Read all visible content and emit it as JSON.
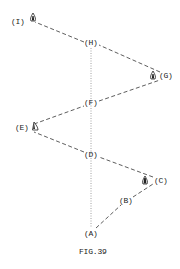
{
  "figure": {
    "caption": "FIG.39",
    "colors": {
      "line": "#333333",
      "dotted_axis": "#888888",
      "text": "#222222",
      "background": "#ffffff"
    },
    "axis": {
      "style": "dotted",
      "x": 91,
      "y_start": 48,
      "y_end": 228
    },
    "points": [
      {
        "id": "A",
        "label": "(A)",
        "x": 91,
        "y": 234,
        "icon": null
      },
      {
        "id": "B",
        "label": "(B)",
        "x": 126,
        "y": 201,
        "icon": null
      },
      {
        "id": "C",
        "label": "(C)",
        "x": 161,
        "y": 181,
        "icon": "drop-shaped-marker-icon"
      },
      {
        "id": "D",
        "label": "(D)",
        "x": 91,
        "y": 155,
        "icon": null
      },
      {
        "id": "E",
        "label": "(E)",
        "x": 23,
        "y": 128,
        "icon": "drop-shaped-marker-icon"
      },
      {
        "id": "F",
        "label": "(F)",
        "x": 91,
        "y": 103,
        "icon": null
      },
      {
        "id": "G",
        "label": "(G)",
        "x": 168,
        "y": 76,
        "icon": "drop-shaped-marker-icon"
      },
      {
        "id": "H",
        "label": "(H)",
        "x": 91,
        "y": 43,
        "icon": null
      },
      {
        "id": "I",
        "label": "(I)",
        "x": 20,
        "y": 22,
        "icon": "drop-shaped-marker-icon"
      }
    ],
    "path_order": [
      "A",
      "B",
      "C",
      "D",
      "E",
      "F",
      "G",
      "H",
      "I"
    ],
    "line_style": "dashed"
  }
}
